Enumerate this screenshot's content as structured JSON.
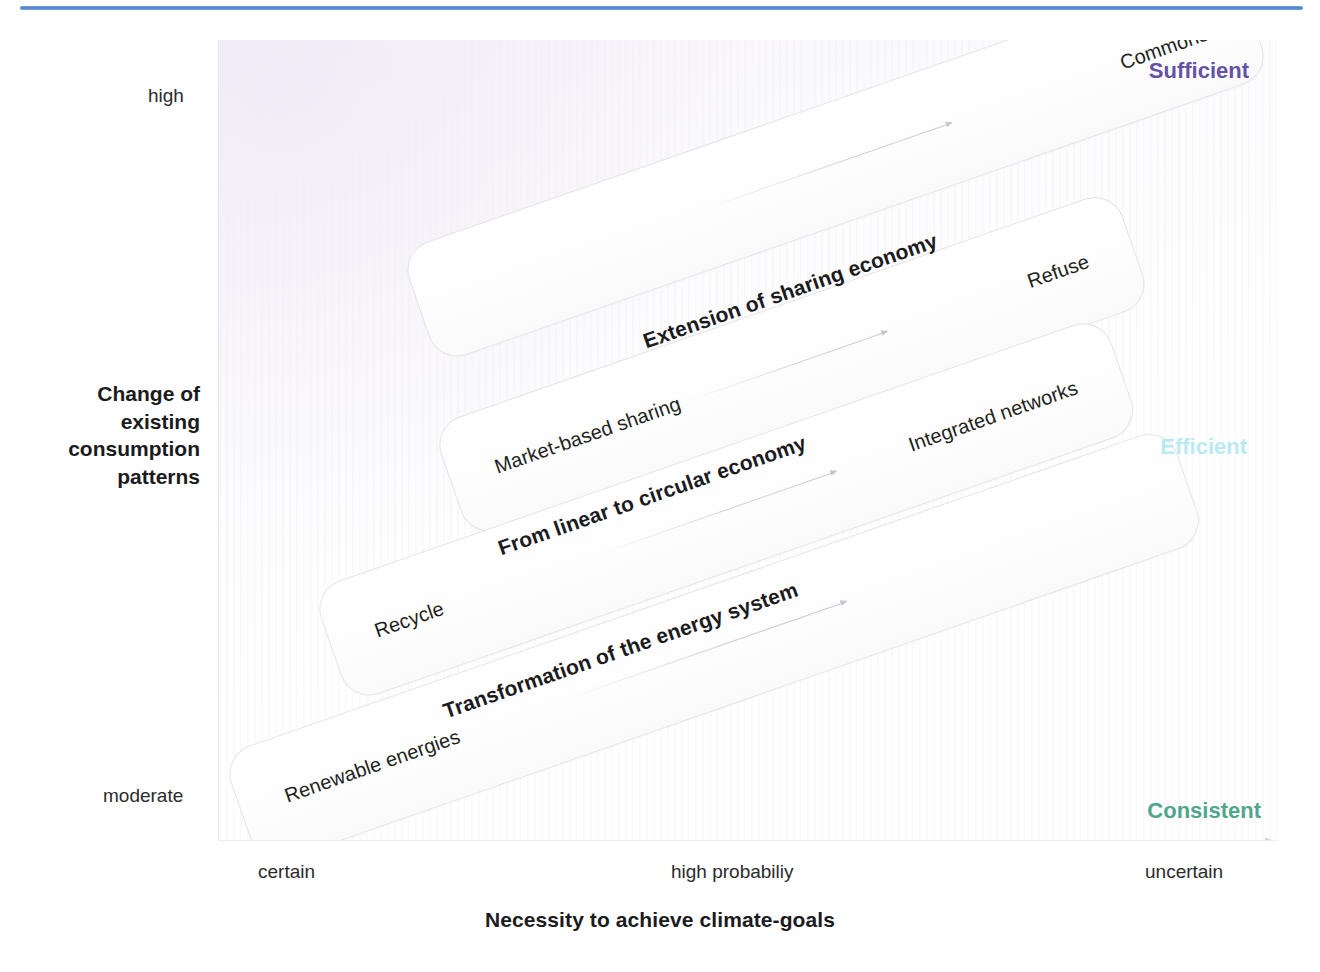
{
  "chart_data": {
    "type": "scatter",
    "title": "",
    "xlabel": "Necessity to achieve climate-goals",
    "ylabel": "Change of existing consumption patterns",
    "x_ticks": [
      "certain",
      "high probabiliy",
      "uncertain"
    ],
    "y_ticks": [
      "moderate",
      "high"
    ],
    "grid": false,
    "legend": "none",
    "quadrant_labels": [
      {
        "name": "Sufficient",
        "color": "#6452a5",
        "position": "top-right"
      },
      {
        "name": "Efficient",
        "color": "#b9eaf2",
        "position": "middle-right"
      },
      {
        "name": "Consistent",
        "color": "#4fa68c",
        "position": "bottom-right"
      }
    ],
    "bands": [
      {
        "left_label": "Renewable energies",
        "right_label": "",
        "level": 1
      },
      {
        "left_label": "Recycle",
        "right_label": "Integrated networks",
        "level": 2
      },
      {
        "left_label": "Market-based sharing",
        "right_label": "Refuse",
        "level": 3
      },
      {
        "left_label": "",
        "right_label": "Commons",
        "level": 4
      }
    ],
    "transitions": [
      "Transformation of the energy system",
      "From linear to circular economy",
      "Extension of sharing economy"
    ]
  },
  "axes": {
    "y": {
      "title_lines": [
        "Change of",
        "existing",
        "consumption",
        "patterns"
      ],
      "title": "Change of existing consumption patterns",
      "low": "moderate",
      "high": "high"
    },
    "x": {
      "title": "Necessity to achieve climate-goals",
      "ticks": {
        "left": "certain",
        "middle": "high probabiliy",
        "right": "uncertain"
      }
    }
  },
  "corners": {
    "sufficient": "Sufficient",
    "efficient": "Efficient",
    "consistent": "Consistent"
  },
  "bands": [
    {
      "id": "band-1",
      "left": "Renewable energies",
      "right": ""
    },
    {
      "id": "band-2",
      "left": "Recycle",
      "right": "Integrated networks"
    },
    {
      "id": "band-3",
      "left": "Market-based sharing",
      "right": "Refuse"
    },
    {
      "id": "band-4",
      "left": "",
      "right": "Commons"
    }
  ],
  "transitions": {
    "energy": "Transformation of the energy system",
    "circular": "From linear to circular economy",
    "sharing": "Extension of sharing economy"
  },
  "colors": {
    "sufficient": "#6452a5",
    "efficient": "#b9eaf2",
    "consistent": "#4fa68c",
    "header_rule": "#4a7fc8",
    "band_border": "#e6e3e9",
    "text": "#231f20"
  }
}
